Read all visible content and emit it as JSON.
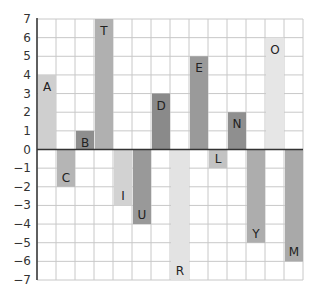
{
  "chart_data": {
    "type": "bar",
    "title": "",
    "xlabel": "",
    "ylabel": "",
    "ylim": [
      -7,
      7
    ],
    "grid": true,
    "legend": null,
    "yticks": [
      7,
      6,
      5,
      4,
      3,
      2,
      1,
      0,
      -1,
      -2,
      -3,
      -4,
      -5,
      -6,
      -7
    ],
    "categories": [
      "A",
      "C",
      "B",
      "T",
      "I",
      "U",
      "D",
      "R",
      "E",
      "L",
      "N",
      "Y",
      "O",
      "M"
    ],
    "values": [
      4,
      -2,
      1,
      7,
      -3,
      -4,
      3,
      -7,
      5,
      -1,
      2,
      -5,
      6,
      -6
    ],
    "colors": [
      "#cfcfcf",
      "#b5b5b5",
      "#8e8e8e",
      "#b0b0b0",
      "#d2d2d2",
      "#999999",
      "#8a8a8a",
      "#e3e3e3",
      "#9a9a9a",
      "#c3c3c3",
      "#8f8f8f",
      "#adadad",
      "#e6e6e6",
      "#a9a9a9"
    ]
  }
}
